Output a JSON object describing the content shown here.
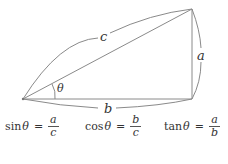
{
  "diagram": {
    "type": "right-triangle",
    "labels": {
      "hypotenuse": "c",
      "opposite": "a",
      "adjacent": "b",
      "angle": "θ"
    },
    "colors": {
      "stroke": "#888888",
      "text": "#333333"
    }
  },
  "formulas": [
    {
      "fn": "sin",
      "var": "θ",
      "eq": "=",
      "num": "a",
      "den": "c"
    },
    {
      "fn": "cos",
      "var": "θ",
      "eq": "=",
      "num": "b",
      "den": "c"
    },
    {
      "fn": "tan",
      "var": "θ",
      "eq": "=",
      "num": "a",
      "den": "b"
    }
  ]
}
